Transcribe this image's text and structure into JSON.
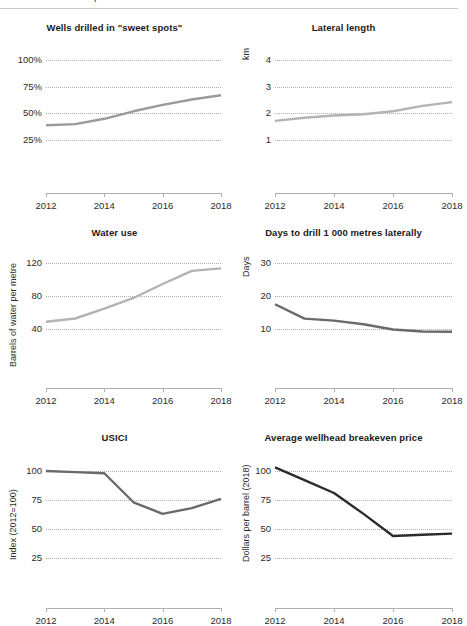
{
  "figure": {
    "clipped_glyph": "p",
    "rule_color": "#c9c9c9"
  },
  "colors": {
    "line_light": "#b3b3b3",
    "line_medium": "#9a9a9a",
    "line_dark": "#6a6a6a",
    "line_darkest": "#2b2b2b",
    "gridline": "#adadad",
    "axis": "#b0b0b0",
    "text": "#2b2b2b"
  },
  "chart_data": [
    {
      "id": "wells-drilled",
      "type": "line",
      "title": "Wells drilled in \"sweet spots\"",
      "xlabel": "",
      "ylabel": "",
      "x": [
        2012,
        2013,
        2014,
        2015,
        2016,
        2017,
        2018
      ],
      "values": [
        39,
        40,
        45,
        52,
        58,
        63,
        67
      ],
      "series": [
        {
          "name": "Wells drilled in sweet spots",
          "values": [
            39,
            40,
            45,
            52,
            58,
            63,
            67
          ]
        }
      ],
      "ylim": [
        0,
        112
      ],
      "yticks": [
        25,
        50,
        75,
        100
      ],
      "yticklabels": [
        "25%",
        "50%",
        "75%",
        "100%"
      ],
      "xticks": [
        2012,
        2014,
        2016,
        2018
      ],
      "xticklabels": [
        "2012",
        "2014",
        "2016",
        "2018"
      ],
      "grid": true,
      "line_color": "#9a9a9a",
      "legend": "none"
    },
    {
      "id": "lateral-length",
      "type": "line",
      "title": "Lateral length",
      "xlabel": "",
      "ylabel": "km",
      "x": [
        2012,
        2013,
        2014,
        2015,
        2016,
        2017,
        2018
      ],
      "values": [
        1.72,
        1.84,
        1.92,
        1.97,
        2.08,
        2.28,
        2.42
      ],
      "series": [
        {
          "name": "Lateral length",
          "values": [
            1.72,
            1.84,
            1.92,
            1.97,
            2.08,
            2.28,
            2.42
          ]
        }
      ],
      "ylim": [
        0,
        4.48
      ],
      "yticks": [
        1,
        2,
        3,
        4
      ],
      "yticklabels": [
        "1",
        "2",
        "3",
        "4"
      ],
      "xticks": [
        2012,
        2014,
        2016,
        2018
      ],
      "xticklabels": [
        "2012",
        "2014",
        "2016",
        "2018"
      ],
      "grid": true,
      "line_color": "#b3b3b3",
      "legend": "none"
    },
    {
      "id": "water-use",
      "type": "line",
      "title": "Water use",
      "xlabel": "",
      "ylabel": "Barrels of water per metre",
      "x": [
        2012,
        2013,
        2014,
        2015,
        2016,
        2017,
        2018
      ],
      "values": [
        49,
        53,
        65,
        78,
        95,
        111,
        114
      ],
      "series": [
        {
          "name": "Water use",
          "values": [
            49,
            53,
            65,
            78,
            95,
            111,
            114
          ]
        }
      ],
      "ylim": [
        0,
        134
      ],
      "yticks": [
        40,
        80,
        120
      ],
      "yticklabels": [
        "40",
        "80",
        "120"
      ],
      "xticks": [
        2012,
        2014,
        2016,
        2018
      ],
      "xticklabels": [
        "2012",
        "2014",
        "2016",
        "2018"
      ],
      "grid": true,
      "line_color": "#b3b3b3",
      "legend": "none"
    },
    {
      "id": "days-to-drill",
      "type": "line",
      "title": "Days to drill 1 000 metres laterally",
      "xlabel": "",
      "ylabel": "Days",
      "x": [
        2012,
        2013,
        2014,
        2015,
        2016,
        2017,
        2018
      ],
      "values": [
        17.6,
        13.2,
        12.6,
        11.5,
        9.9,
        9.3,
        9.2
      ],
      "series": [
        {
          "name": "Days to drill",
          "values": [
            17.6,
            13.2,
            12.6,
            11.5,
            9.9,
            9.3,
            9.2
          ]
        }
      ],
      "ylim": [
        0,
        33.5
      ],
      "yticks": [
        10,
        20,
        30
      ],
      "yticklabels": [
        "10",
        "20",
        "30"
      ],
      "xticks": [
        2012,
        2014,
        2016,
        2018
      ],
      "xticklabels": [
        "2012",
        "2014",
        "2016",
        "2018"
      ],
      "grid": true,
      "line_color": "#6a6a6a",
      "legend": "none"
    },
    {
      "id": "usici",
      "type": "line",
      "title": "USICI",
      "xlabel": "",
      "ylabel": "Index (2012=100)",
      "x": [
        2012,
        2013,
        2014,
        2015,
        2016,
        2017,
        2018
      ],
      "values": [
        100,
        99,
        98,
        73,
        63,
        68,
        76
      ],
      "series": [
        {
          "name": "USICI",
          "values": [
            100,
            99,
            98,
            73,
            63,
            68,
            76
          ]
        }
      ],
      "ylim": [
        0,
        112
      ],
      "yticks": [
        25,
        50,
        75,
        100
      ],
      "yticklabels": [
        "25",
        "50",
        "75",
        "100"
      ],
      "xticks": [
        2012,
        2014,
        2016,
        2018
      ],
      "xticklabels": [
        "2012",
        "2014",
        "2016",
        "2018"
      ],
      "grid": true,
      "line_color": "#6a6a6a",
      "legend": "none"
    },
    {
      "id": "breakeven-price",
      "type": "line",
      "title": "Average wellhead breakeven price",
      "xlabel": "",
      "ylabel": "Dollars per barrel (2018)",
      "x": [
        2012,
        2013,
        2014,
        2015,
        2016,
        2017,
        2018
      ],
      "values": [
        103,
        92,
        81,
        63,
        44,
        45,
        46
      ],
      "series": [
        {
          "name": "Breakeven price",
          "values": [
            103,
            92,
            81,
            63,
            44,
            45,
            46
          ]
        }
      ],
      "ylim": [
        0,
        112
      ],
      "yticks": [
        25,
        50,
        75,
        100
      ],
      "yticklabels": [
        "25",
        "50",
        "75",
        "100"
      ],
      "xticks": [
        2012,
        2014,
        2016,
        2018
      ],
      "xticklabels": [
        "2012",
        "2014",
        "2016",
        "2018"
      ],
      "grid": true,
      "line_color": "#2b2b2b",
      "legend": "none"
    }
  ]
}
